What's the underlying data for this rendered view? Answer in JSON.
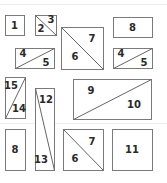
{
  "diagram": {
    "type": "tangram-style rectangle partition layout",
    "shapes": [
      {
        "id": "box-1",
        "x": 5,
        "y": 15,
        "w": 19,
        "h": 20,
        "diagonal": null,
        "labels": [
          {
            "text": "1",
            "x": 14.5,
            "y": 29
          }
        ]
      },
      {
        "id": "box-2-3",
        "x": 35,
        "y": 15,
        "w": 21,
        "h": 20,
        "diagonal": "tl-br",
        "labels": [
          {
            "text": "3",
            "x": 51,
            "y": 23
          },
          {
            "text": "2",
            "x": 41,
            "y": 32
          }
        ]
      },
      {
        "id": "box-6-7-top",
        "x": 61,
        "y": 27,
        "w": 42,
        "h": 42,
        "diagonal": "tl-br",
        "labels": [
          {
            "text": "7",
            "x": 92,
            "y": 42
          },
          {
            "text": "6",
            "x": 75,
            "y": 60
          }
        ]
      },
      {
        "id": "box-8-top",
        "x": 113,
        "y": 17,
        "w": 39,
        "h": 20,
        "diagonal": null,
        "labels": [
          {
            "text": "8",
            "x": 132.5,
            "y": 31
          }
        ]
      },
      {
        "id": "box-4-5-left",
        "x": 15,
        "y": 48,
        "w": 39,
        "h": 20,
        "diagonal": "bl-tr",
        "labels": [
          {
            "text": "4",
            "x": 23,
            "y": 57
          },
          {
            "text": "5",
            "x": 46,
            "y": 66
          }
        ]
      },
      {
        "id": "box-4-5-right",
        "x": 113,
        "y": 48,
        "w": 39,
        "h": 20,
        "diagonal": "bl-tr",
        "labels": [
          {
            "text": "4",
            "x": 121,
            "y": 57
          },
          {
            "text": "5",
            "x": 144,
            "y": 66
          }
        ]
      },
      {
        "id": "box-15-14",
        "x": 5,
        "y": 77,
        "w": 20,
        "h": 41,
        "diagonal": "tr-bl",
        "labels": [
          {
            "text": "15",
            "x": 11,
            "y": 89
          },
          {
            "text": "14",
            "x": 19,
            "y": 112
          }
        ]
      },
      {
        "id": "box-12-13",
        "x": 35,
        "y": 88,
        "w": 19,
        "h": 82,
        "diagonal": "tl-br",
        "labels": [
          {
            "text": "12",
            "x": 46,
            "y": 103
          },
          {
            "text": "13",
            "x": 41,
            "y": 163
          }
        ]
      },
      {
        "id": "box-9-10",
        "x": 73,
        "y": 79,
        "w": 78,
        "h": 40,
        "diagonal": "bl-tr",
        "labels": [
          {
            "text": "9",
            "x": 91,
            "y": 94
          },
          {
            "text": "10",
            "x": 134,
            "y": 108
          }
        ]
      },
      {
        "id": "box-8-bottom",
        "x": 5,
        "y": 129,
        "w": 20,
        "h": 41,
        "diagonal": null,
        "labels": [
          {
            "text": "8",
            "x": 15,
            "y": 153
          }
        ]
      },
      {
        "id": "box-6-7-bottom",
        "x": 63,
        "y": 129,
        "w": 40,
        "h": 41,
        "diagonal": "tl-br",
        "labels": [
          {
            "text": "7",
            "x": 92,
            "y": 145
          },
          {
            "text": "6",
            "x": 75,
            "y": 162
          }
        ]
      },
      {
        "id": "box-11",
        "x": 112,
        "y": 129,
        "w": 40,
        "h": 41,
        "diagonal": null,
        "labels": [
          {
            "text": "11",
            "x": 132,
            "y": 153
          }
        ]
      }
    ]
  }
}
